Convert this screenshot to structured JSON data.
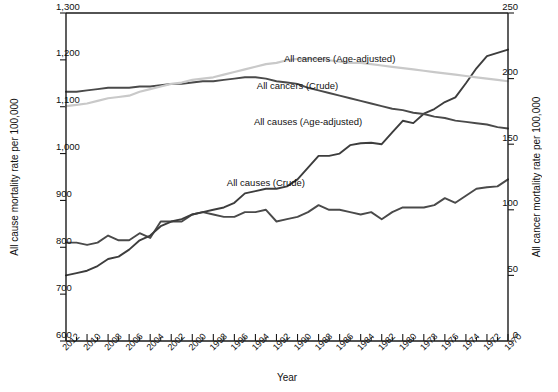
{
  "chart_data": {
    "type": "line",
    "title": "",
    "orientation_note": "figure rendered rotated 180 degrees",
    "xlabel": "Year",
    "ylabel_left": "All cancer mortality rate per 100,000",
    "ylabel_right": "All cause mortality rate per 100,000",
    "ylim_left": [
      0,
      250
    ],
    "ylim_right": [
      600,
      1300
    ],
    "ytick_left": [
      "0",
      "50",
      "100",
      "150",
      "200",
      "250"
    ],
    "ytick_left_values": [
      0,
      50,
      100,
      150,
      200,
      250
    ],
    "ytick_right": [
      "600",
      "700",
      "800",
      "900",
      "1,000",
      "1,100",
      "1,200",
      "1,300"
    ],
    "ytick_right_values": [
      600,
      700,
      800,
      900,
      1000,
      1100,
      1200,
      1300
    ],
    "grid": false,
    "legend": "inline-labels",
    "x": [
      1970,
      1971,
      1972,
      1973,
      1974,
      1975,
      1976,
      1977,
      1978,
      1979,
      1980,
      1981,
      1982,
      1983,
      1984,
      1985,
      1986,
      1987,
      1988,
      1989,
      1990,
      1991,
      1992,
      1993,
      1994,
      1995,
      1996,
      1997,
      1998,
      1999,
      2000,
      2001,
      2002,
      2003,
      2004,
      2005,
      2006,
      2007,
      2008,
      2009,
      2010,
      2011,
      2012
    ],
    "xtick_labels": [
      "1970",
      "1972",
      "1974",
      "1976",
      "1978",
      "1980",
      "1982",
      "1984",
      "1986",
      "1988",
      "1990",
      "1992",
      "1994",
      "1996",
      "1998",
      "2000",
      "2002",
      "2004",
      "2006",
      "2008",
      "2010",
      "2012"
    ],
    "xtick_values": [
      1970,
      1972,
      1974,
      1976,
      1978,
      1980,
      1982,
      1984,
      1986,
      1988,
      1990,
      1992,
      1994,
      1996,
      1998,
      2000,
      2002,
      2004,
      2006,
      2008,
      2010,
      2012
    ],
    "series": [
      {
        "name": "All causes (Crude)",
        "axis": "right",
        "color": "#4a4a4a",
        "label_x": 1993,
        "label_y_right": 930,
        "values": [
          945,
          930,
          928,
          925,
          910,
          895,
          905,
          890,
          885,
          885,
          885,
          875,
          860,
          875,
          870,
          875,
          880,
          880,
          890,
          875,
          865,
          860,
          855,
          880,
          875,
          875,
          865,
          865,
          870,
          875,
          870,
          855,
          855,
          855,
          820,
          830,
          815,
          815,
          825,
          810,
          805,
          810,
          810
        ]
      },
      {
        "name": "All causes (Age-adjusted)",
        "axis": "right",
        "color": "#3d3d3d",
        "label_x": 1989,
        "label_y_right": 1060,
        "values": [
          1222,
          1215,
          1208,
          1182,
          1150,
          1120,
          1110,
          1095,
          1085,
          1065,
          1070,
          1045,
          1020,
          1023,
          1022,
          1018,
          1000,
          995,
          995,
          970,
          945,
          930,
          925,
          925,
          920,
          915,
          895,
          885,
          880,
          875,
          870,
          860,
          855,
          845,
          825,
          815,
          795,
          780,
          775,
          760,
          750,
          745,
          740
        ]
      },
      {
        "name": "All cancers (Crude)",
        "axis": "left",
        "color": "#4a4a4a",
        "label_x": 1990,
        "label_y_left": 192,
        "values": [
          162,
          163,
          165,
          166,
          167,
          168,
          170,
          171,
          173,
          174,
          176,
          177,
          179,
          181,
          183,
          185,
          187,
          189,
          191,
          193,
          196,
          197,
          198,
          200,
          201,
          201,
          200,
          199,
          198,
          198,
          197,
          196,
          196,
          195,
          194,
          194,
          193,
          193,
          193,
          192,
          191,
          190,
          190
        ]
      },
      {
        "name": "All cancers (Age-adjusted)",
        "axis": "left",
        "color": "#c9c9c9",
        "label_x": 1986,
        "label_y_left": 213,
        "values": [
          198,
          199,
          200,
          201,
          202,
          203,
          204,
          205,
          206,
          207,
          208,
          209,
          210,
          211,
          212,
          212,
          213,
          214,
          215,
          215,
          215,
          214,
          212,
          211,
          209,
          207,
          205,
          203,
          201,
          200,
          199,
          197,
          196,
          194,
          192,
          190,
          187,
          186,
          185,
          183,
          181,
          180,
          179
        ]
      }
    ]
  }
}
